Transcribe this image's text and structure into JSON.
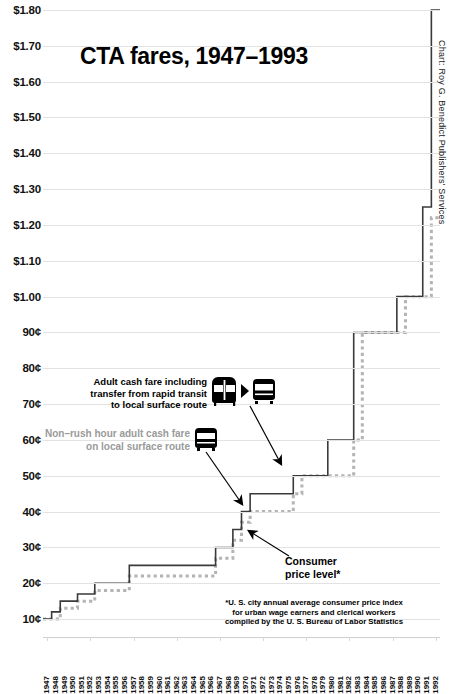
{
  "title": "CTA fares, 1947–1993",
  "credit": "Chart: Roy G. Benedict Publishers' Services",
  "annotations": {
    "transfer": "Adult cash fare including transfer from rapid transit to local surface route",
    "transfer_lines": [
      "Adult cash fare including",
      "transfer from rapid transit",
      "to local surface route"
    ],
    "nonrush": "Non–rush hour adult cash fare on local surface route",
    "nonrush_lines": [
      "Non–rush hour adult cash fare",
      "on local surface route"
    ],
    "cpi": "Consumer price level*",
    "cpi_lines": [
      "Consumer",
      "price level*"
    ],
    "footnote_lines": [
      "*U. S. city annual average consumer price index",
      "for urban wage earners and clerical workers",
      "compiled by the U. S. Bureau of Labor Statistics"
    ]
  },
  "icons": {
    "rapid_transit": "train-icon",
    "arrow": "right-arrow-icon",
    "surface_bus": "bus-icon",
    "nonrush_bus": "bus-icon"
  },
  "colors": {
    "fare_line": "#3a3a3a",
    "cpi_line": "#b4b4b4",
    "grid": "#e2e2e2",
    "text": "#111111",
    "muted_text": "#9a9a9a"
  },
  "chart_data": {
    "type": "line",
    "subtype": "step",
    "title": "CTA fares, 1947–1993",
    "xlabel": "",
    "ylabel": "",
    "grid": true,
    "legend": "annotations",
    "ylim": [
      5,
      180
    ],
    "y_unit": "cents",
    "yticks": [
      10,
      20,
      30,
      40,
      50,
      60,
      70,
      80,
      90,
      100,
      110,
      120,
      130,
      140,
      150,
      160,
      170,
      180
    ],
    "ytick_labels": [
      "10¢",
      "20¢",
      "30¢",
      "40¢",
      "50¢",
      "60¢",
      "70¢",
      "80¢",
      "90¢",
      "$1.00",
      "$1.10",
      "$1.20",
      "$1.30",
      "$1.40",
      "$1.50",
      "$1.60",
      "$1.70",
      "$1.80"
    ],
    "x": [
      1947,
      1948,
      1949,
      1950,
      1951,
      1952,
      1953,
      1954,
      1955,
      1956,
      1957,
      1958,
      1959,
      1960,
      1961,
      1962,
      1963,
      1964,
      1965,
      1966,
      1967,
      1968,
      1969,
      1970,
      1971,
      1972,
      1973,
      1974,
      1975,
      1976,
      1977,
      1978,
      1979,
      1980,
      1981,
      1982,
      1983,
      1984,
      1985,
      1986,
      1987,
      1988,
      1989,
      1990,
      1991,
      1992
    ],
    "xtick_labels": [
      "1947",
      "1948",
      "1949",
      "1950",
      "1951",
      "1952",
      "1953",
      "1954",
      "1955",
      "1956",
      "1957",
      "1958",
      "1959",
      "1960",
      "1961",
      "1962",
      "1963",
      "1964",
      "1965",
      "1966",
      "1967",
      "1968",
      "1969",
      "1970",
      "1971",
      "1972",
      "1973",
      "1974",
      "1975",
      "1976",
      "1977",
      "1978",
      "1979",
      "1980",
      "1981",
      "1982",
      "1983",
      "1984",
      "1985",
      "1986",
      "1987",
      "1988",
      "1989",
      "1990",
      "1991",
      "1992"
    ],
    "series": [
      {
        "name": "Adult cash fare including transfer from rapid transit to local surface route",
        "style": "solid",
        "color": "#3a3a3a",
        "values": [
          10,
          12,
          15,
          15,
          17,
          17,
          20,
          20,
          20,
          20,
          25,
          25,
          25,
          25,
          25,
          25,
          25,
          25,
          25,
          25,
          30,
          30,
          35,
          40,
          45,
          45,
          45,
          45,
          45,
          50,
          50,
          50,
          50,
          60,
          60,
          60,
          90,
          90,
          90,
          90,
          90,
          100,
          100,
          100,
          125,
          180
        ]
      },
      {
        "name": "Non-rush hour adult cash fare on local surface route",
        "style": "dotted",
        "color": "#b4b4b4",
        "values": [
          10,
          10,
          13,
          13,
          15,
          15,
          18,
          18,
          18,
          18,
          22,
          22,
          22,
          22,
          22,
          22,
          22,
          22,
          22,
          22,
          27,
          27,
          32,
          37,
          40,
          40,
          40,
          40,
          40,
          45,
          50,
          50,
          50,
          50,
          50,
          50,
          60,
          90,
          90,
          90,
          90,
          90,
          100,
          100,
          100,
          122
        ]
      },
      {
        "name": "Consumer price level*",
        "style": "dotted",
        "color": "#b4b4b4",
        "note": "indexed to fare scale",
        "values": [
          10,
          10,
          13,
          13,
          15,
          15,
          18,
          18,
          18,
          18,
          22,
          22,
          22,
          22,
          22,
          22,
          22,
          22,
          22,
          22,
          27,
          27,
          32,
          37,
          40,
          40,
          40,
          40,
          40,
          45,
          50,
          50,
          50,
          50,
          50,
          50,
          60,
          90,
          90,
          90,
          90,
          90,
          100,
          100,
          100,
          122
        ]
      }
    ]
  }
}
